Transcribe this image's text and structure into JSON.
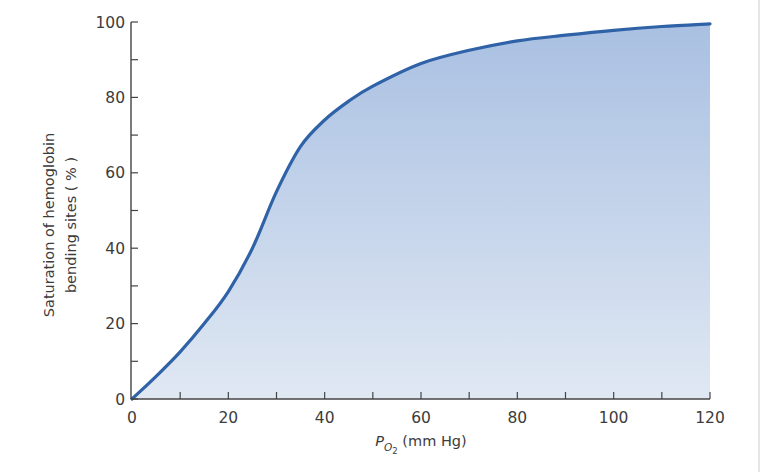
{
  "chart_data": {
    "type": "area",
    "title": "",
    "xlabel": "P_O2 (mm Hg)",
    "xlabel_parts": {
      "main": "P",
      "subscript": "O",
      "sub_subscript": "2",
      "rest": " (mm Hg)"
    },
    "ylabel": "Saturation of hemoglobin bending sites (%)",
    "ylabel_lines": [
      "Saturation of hemoglobin",
      "bending sites ( % )"
    ],
    "xlim": [
      0,
      120
    ],
    "ylim": [
      0,
      100
    ],
    "x_ticks_major": [
      0,
      20,
      40,
      60,
      80,
      100,
      120
    ],
    "x_ticks_minor": [
      10,
      30,
      50,
      70,
      90,
      110
    ],
    "y_ticks_major": [
      0,
      20,
      40,
      60,
      80,
      100
    ],
    "y_ticks_minor": [
      10,
      30,
      50,
      70,
      90
    ],
    "grid": false,
    "legend": null,
    "series": [
      {
        "name": "Hemoglobin O2 saturation",
        "x": [
          0,
          5,
          10,
          15,
          20,
          25,
          30,
          35,
          40,
          45,
          50,
          60,
          70,
          80,
          90,
          100,
          110,
          120
        ],
        "values": [
          0,
          6,
          12.5,
          20,
          28.5,
          40,
          55,
          67,
          74,
          79,
          83,
          89,
          92.5,
          95,
          96.5,
          97.8,
          98.8,
          99.5
        ]
      }
    ],
    "colors": {
      "line": "#2f62a6",
      "fill_top": "#a9c0e2",
      "fill_bottom": "#e0e8f3",
      "axis": "#444444",
      "text": "#3c3c3c"
    }
  }
}
